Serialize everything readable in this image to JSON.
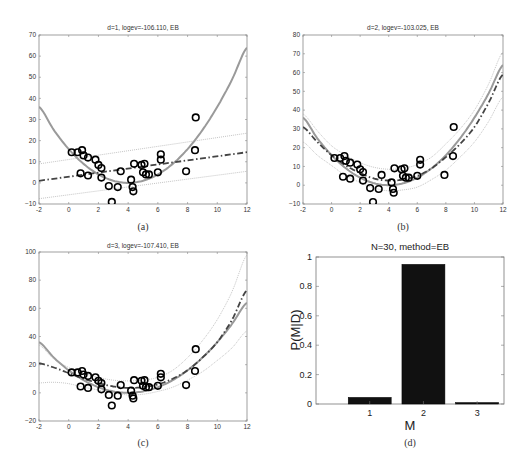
{
  "chart_data": [
    {
      "id": "a",
      "type": "scatter",
      "caption": "(a)",
      "title": "d=1, logev=-106.110, EB",
      "xlim": [
        -2,
        12
      ],
      "ylim": [
        -10,
        70
      ],
      "xticks": [
        -2,
        0,
        2,
        4,
        6,
        8,
        10,
        12
      ],
      "yticks": [
        -10,
        0,
        10,
        20,
        30,
        40,
        50,
        60,
        70
      ],
      "grid": false,
      "points": [
        [
          0.2,
          14.5
        ],
        [
          0.6,
          14.5
        ],
        [
          0.9,
          15.5
        ],
        [
          1.0,
          13
        ],
        [
          1.3,
          12
        ],
        [
          1.8,
          11
        ],
        [
          2.0,
          8.5
        ],
        [
          2.2,
          7
        ],
        [
          0.8,
          4.5
        ],
        [
          1.3,
          3.5
        ],
        [
          2.2,
          2.5
        ],
        [
          2.7,
          -1.5
        ],
        [
          3.3,
          -2
        ],
        [
          3.5,
          5.5
        ],
        [
          2.9,
          -9
        ],
        [
          4.2,
          1.5
        ],
        [
          4.3,
          -2
        ],
        [
          4.35,
          -4
        ],
        [
          4.4,
          9
        ],
        [
          4.9,
          8.5
        ],
        [
          5.1,
          9
        ],
        [
          5.0,
          5
        ],
        [
          5.2,
          4
        ],
        [
          5.4,
          4
        ],
        [
          6.0,
          5
        ],
        [
          6.2,
          13.5
        ],
        [
          6.2,
          11
        ],
        [
          7.9,
          5.5
        ],
        [
          8.5,
          15.5
        ],
        [
          8.55,
          31
        ]
      ],
      "series": [
        {
          "name": "true function",
          "style": "solid gray",
          "x": [
            -2,
            -1,
            0,
            1,
            2,
            3,
            4,
            5,
            6,
            7,
            8,
            9,
            10,
            11,
            12
          ],
          "values": [
            36,
            25,
            16,
            9,
            4,
            1,
            0,
            1,
            4,
            9,
            16,
            25,
            36,
            49,
            64
          ]
        },
        {
          "name": "posterior mean (d=1)",
          "style": "dash-dot dark",
          "x": [
            -2,
            12
          ],
          "values": [
            1,
            14.5
          ]
        },
        {
          "name": "upper band",
          "style": "dotted",
          "x": [
            -2,
            12
          ],
          "values": [
            9,
            23.5
          ]
        },
        {
          "name": "lower band",
          "style": "dotted",
          "x": [
            -2,
            12
          ],
          "values": [
            -7.5,
            5.5
          ]
        }
      ]
    },
    {
      "id": "b",
      "type": "scatter",
      "caption": "(b)",
      "title": "d=2, logev=-103.025, EB",
      "xlim": [
        -2,
        12
      ],
      "ylim": [
        -10,
        80
      ],
      "xticks": [
        -2,
        0,
        2,
        4,
        6,
        8,
        10,
        12
      ],
      "yticks": [
        -10,
        0,
        10,
        20,
        30,
        40,
        50,
        60,
        70,
        80
      ],
      "grid": false,
      "points": "same as (a)",
      "series": [
        {
          "name": "true function",
          "style": "solid gray",
          "x": [
            -2,
            -1,
            0,
            1,
            2,
            3,
            4,
            5,
            6,
            7,
            8,
            9,
            10,
            11,
            12
          ],
          "values": [
            36,
            25,
            16,
            9,
            4,
            1,
            0,
            1,
            4,
            9,
            16,
            25,
            36,
            49,
            64
          ]
        },
        {
          "name": "posterior mean (d=2)",
          "style": "dash-dot dark",
          "x": [
            -2,
            -1,
            0,
            1,
            2,
            3,
            4,
            5,
            6,
            7,
            8,
            9,
            10,
            11,
            12
          ],
          "values": [
            31,
            23,
            16,
            10.5,
            6.5,
            3.5,
            2.5,
            3,
            5,
            9,
            15,
            22,
            31,
            44,
            59
          ]
        },
        {
          "name": "upper band",
          "style": "dotted",
          "x": [
            -2,
            -1,
            0,
            1,
            2,
            3,
            4,
            5,
            6,
            7,
            8,
            9,
            10,
            11,
            12
          ],
          "values": [
            38,
            29,
            21,
            16,
            12,
            9.5,
            8.5,
            9,
            11,
            15,
            22,
            30,
            40,
            54,
            71
          ]
        },
        {
          "name": "lower band",
          "style": "dotted",
          "x": [
            -2,
            -1,
            0,
            1,
            2,
            3,
            4,
            5,
            6,
            7,
            8,
            9,
            10,
            11,
            12
          ],
          "values": [
            23,
            16,
            10.5,
            5,
            1.5,
            -1.5,
            -3,
            -2.5,
            -1,
            3,
            8,
            15,
            23,
            34,
            47
          ]
        }
      ]
    },
    {
      "id": "c",
      "type": "scatter",
      "caption": "(c)",
      "title": "d=3, logev=-107.410, EB",
      "xlim": [
        -2,
        12
      ],
      "ylim": [
        -20,
        100
      ],
      "xticks": [
        -2,
        0,
        2,
        4,
        6,
        8,
        10,
        12
      ],
      "yticks": [
        -20,
        0,
        20,
        40,
        60,
        80,
        100
      ],
      "grid": false,
      "points": "same as (a)",
      "series": [
        {
          "name": "true function",
          "style": "solid gray",
          "x": [
            -2,
            -1,
            0,
            1,
            2,
            3,
            4,
            5,
            6,
            7,
            8,
            9,
            10,
            11,
            12
          ],
          "values": [
            36,
            25,
            16,
            9,
            4,
            1,
            0,
            1,
            4,
            9,
            16,
            25,
            36,
            49,
            64
          ]
        },
        {
          "name": "posterior mean (d=3)",
          "style": "dash-dot dark",
          "x": [
            -2,
            -1,
            0,
            1,
            2,
            3,
            4,
            5,
            6,
            7,
            8,
            9,
            10,
            11,
            12
          ],
          "values": [
            21,
            18,
            14,
            10,
            7,
            4.5,
            3.5,
            4,
            6,
            10,
            16,
            25,
            36,
            52,
            73
          ]
        },
        {
          "name": "upper band",
          "style": "dotted",
          "x": [
            -2,
            -1,
            0,
            1,
            2,
            3,
            4,
            5,
            6,
            7,
            8,
            9,
            10,
            11,
            12
          ],
          "values": [
            34,
            24,
            18,
            14,
            11,
            9,
            8.5,
            9,
            11,
            16,
            25,
            37,
            52,
            72,
            98
          ]
        },
        {
          "name": "lower band",
          "style": "dotted",
          "x": [
            -2,
            -1,
            0,
            1,
            2,
            3,
            4,
            5,
            6,
            7,
            8,
            9,
            10,
            11,
            12
          ],
          "values": [
            7,
            7.5,
            6.5,
            4,
            2,
            0,
            -1.5,
            -1,
            1,
            4,
            9,
            15,
            23,
            32,
            44
          ]
        }
      ]
    },
    {
      "id": "d",
      "type": "bar",
      "caption": "(d)",
      "title": "N=30, method=EB",
      "xlabel": "M",
      "ylabel": "P(M|D)",
      "categories": [
        "1",
        "2",
        "3"
      ],
      "values": [
        0.045,
        0.95,
        0.01
      ],
      "ylim": [
        0,
        1
      ],
      "yticks": [
        0,
        0.2,
        0.4,
        0.6,
        0.8,
        1
      ],
      "grid": false
    }
  ],
  "captions": {
    "a": "(a)",
    "b": "(b)",
    "c": "(c)",
    "d": "(d)"
  },
  "titles": {
    "a": "d=1, logev=-106.110, EB",
    "b": "d=2, logev=-103.025, EB",
    "c": "d=3, logev=-107.410, EB",
    "d": "N=30, method=EB"
  },
  "axis_labels": {
    "d_x": "M",
    "d_y": "P(M|D)"
  },
  "colors": {
    "truth": "#9a9a9a",
    "mean": "#444444",
    "band": "#aaaaaa",
    "bar": "#111111",
    "marker": "#000000"
  }
}
